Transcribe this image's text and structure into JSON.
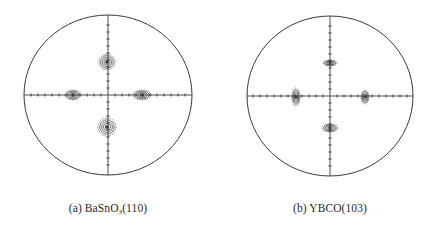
{
  "figure": {
    "line_color": "#3a3a3a",
    "panels": [
      {
        "id": "a",
        "label_prefix": "(a) BaSnO",
        "label_subscript": "3",
        "label_suffix": "(110)",
        "full_label": "(a) BaSnO3(110)",
        "center": [
          108,
          95
        ],
        "rx": 84,
        "ry": 80,
        "spots": [
          {
            "position": "top",
            "x": 107,
            "y": 62,
            "shape": "round",
            "rx": 8,
            "ry": 8
          },
          {
            "position": "bottom",
            "x": 107,
            "y": 127,
            "shape": "round",
            "rx": 9,
            "ry": 9
          },
          {
            "position": "left",
            "x": 73,
            "y": 95,
            "shape": "oval-horizontal",
            "rx": 8,
            "ry": 5
          },
          {
            "position": "right",
            "x": 142,
            "y": 95,
            "shape": "oval-horizontal",
            "rx": 9,
            "ry": 5
          }
        ]
      },
      {
        "id": "b",
        "label_prefix": "(b) YBCO",
        "label_subscript": "",
        "label_suffix": "(103)",
        "full_label": "(b) YBCO(103)",
        "center": [
          330,
          96
        ],
        "rx": 83,
        "ry": 80,
        "spots": [
          {
            "position": "top",
            "x": 330,
            "y": 63,
            "shape": "oval-horizontal",
            "rx": 7,
            "ry": 3
          },
          {
            "position": "bottom",
            "x": 330,
            "y": 128,
            "shape": "oval-horizontal",
            "rx": 8,
            "ry": 4
          },
          {
            "position": "left",
            "x": 296,
            "y": 97,
            "shape": "oval-vertical",
            "rx": 4,
            "ry": 9
          },
          {
            "position": "right",
            "x": 365,
            "y": 97,
            "shape": "oval-vertical",
            "rx": 4,
            "ry": 7
          }
        ]
      }
    ]
  }
}
